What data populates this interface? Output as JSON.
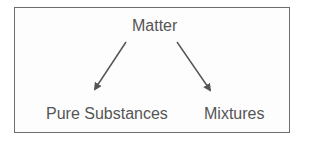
{
  "diagram": {
    "type": "tree",
    "root": {
      "label": "Matter"
    },
    "children": [
      {
        "label": "Pure Substances"
      },
      {
        "label": "Mixtures"
      }
    ],
    "edges": [
      {
        "from": "Matter",
        "to": "Pure Substances"
      },
      {
        "from": "Matter",
        "to": "Mixtures"
      }
    ],
    "colors": {
      "text": "#555555",
      "arrow": "#555555",
      "border": "#6e6e6e",
      "background": "#ffffff"
    }
  }
}
